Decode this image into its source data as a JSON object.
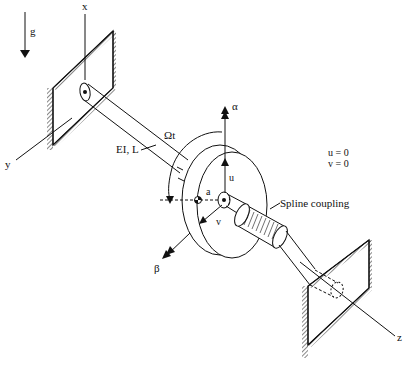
{
  "diagram": {
    "labels": {
      "gravity": "g",
      "x_axis": "x",
      "y_axis": "y",
      "z_axis": "z",
      "rotation": "Ωt",
      "shaft_props": "EI, L",
      "alpha": "α",
      "beta": "β",
      "u": "u",
      "v": "v",
      "a": "a",
      "spline": "Spline coupling",
      "bc_u": "u = 0",
      "bc_v": "v = 0"
    }
  }
}
